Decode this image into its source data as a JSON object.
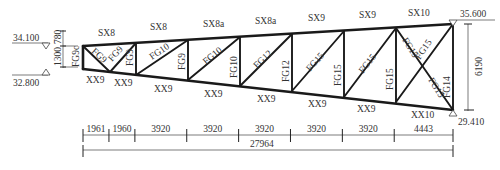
{
  "diagram": {
    "type": "steel-truss-elevation",
    "top_chord_labels": [
      "SX8",
      "SX8",
      "SX8a",
      "SX8a",
      "SX9",
      "SX9",
      "SX10"
    ],
    "bottom_chord_labels": [
      "XX9",
      "XX9",
      "XX9",
      "XX9",
      "XX9",
      "XX9",
      "XX9",
      "XX10"
    ],
    "end_post_label": "FG9c",
    "web_labels": {
      "diag_1a": "FG9",
      "diag_1b": "FG9",
      "vert_1": "FG9",
      "diag_2": "FG10",
      "vert_2": "FG9",
      "diag_3": "FG10",
      "vert_3": "FG10",
      "diag_4": "FG12",
      "vert_4": "FG12",
      "diag_5": "FG15",
      "vert_5": "FG15",
      "diag_6": "FG15",
      "vert_6": "FG15",
      "diag_7a": "FG15",
      "diag_7b": "FG15",
      "diag_7c": "FG15",
      "end_vert": "FG14"
    },
    "elevations": {
      "left_top": "34.100",
      "left_bottom": "32.800",
      "right_top": "35.600",
      "right_bottom": "29.410"
    },
    "left_dims": {
      "upper": "780",
      "lower": "1300"
    },
    "right_dim": "6190",
    "span_dims": [
      "1961",
      "1960",
      "3920",
      "3920",
      "3920",
      "3920",
      "3920",
      "4443"
    ],
    "total_span": "27964"
  }
}
